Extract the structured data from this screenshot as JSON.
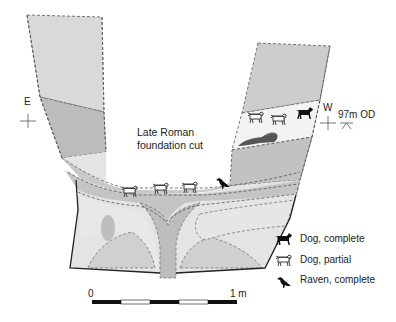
{
  "title": "Late Roman foundation cut",
  "orientation": {
    "left": "E",
    "right": "W"
  },
  "datum": "97m OD",
  "scale_bar": {
    "start_label": "0",
    "end_label": "1 m",
    "segments": 5
  },
  "legend": [
    {
      "icon": "dog-complete-icon",
      "label": "Dog, complete"
    },
    {
      "icon": "dog-partial-icon",
      "label": "Dog, partial"
    },
    {
      "icon": "raven-complete-icon",
      "label": "Raven, complete"
    }
  ],
  "colors": {
    "light_fill": "#d6d6d6",
    "mid_fill": "#b9b9b9",
    "pale_fill": "#e9e9e9",
    "white_fill": "#f4f4f4",
    "outline": "#333333"
  },
  "finds": {
    "upper_right_layer": [
      "dog-partial",
      "dog-partial",
      "dog-complete",
      "dog-partial-skull"
    ],
    "lower_layer": [
      "dog-partial",
      "dog-partial",
      "dog-partial",
      "raven-complete"
    ]
  }
}
